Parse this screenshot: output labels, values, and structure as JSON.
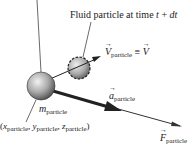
{
  "diagram": {
    "title_label": "Fluid particle at time t + dt",
    "title_parts": {
      "prefix": "Fluid particle at time ",
      "t": "t",
      "plus": " + ",
      "dt": "dt"
    },
    "velocity_label": {
      "symbol": "V",
      "subscript": "particle",
      "equiv": " ≡ ",
      "rhs": "V"
    },
    "mass_label": {
      "symbol": "m",
      "subscript": "particle"
    },
    "position_label": {
      "open": "(",
      "x": "x",
      "y": "y",
      "z": "z",
      "subscript": "particle",
      "sep": ", ",
      "close": ")"
    },
    "acceleration_label": {
      "symbol": "a",
      "subscript": "particle"
    },
    "force_label": {
      "symbol": "F",
      "subscript": "particle"
    },
    "colors": {
      "sphere_light": "#e6e6e6",
      "sphere_dark": "#555555",
      "line": "#333333",
      "text": "#222222"
    }
  }
}
